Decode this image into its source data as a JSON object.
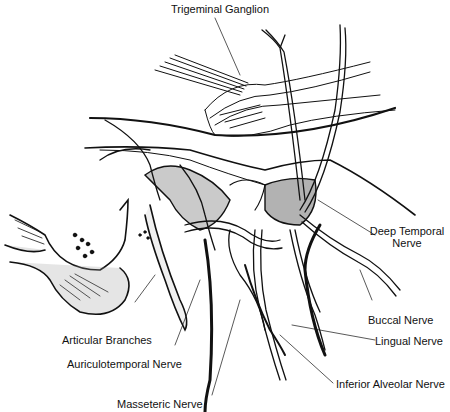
{
  "figure": {
    "labels": {
      "trigeminal_ganglion": "Trigeminal Ganglion",
      "deep_temporal_nerve_line1": "Deep Temporal",
      "deep_temporal_nerve_line2": "Nerve",
      "buccal_nerve": "Buccal Nerve",
      "lingual_nerve": "Lingual Nerve",
      "inferior_alveolar_nerve": "Inferior Alveolar Nerve",
      "articular_branches": "Articular Branches",
      "auriculotemporal_nerve": "Auriculotemporal Nerve",
      "masseteric_nerve": "Masseteric Nerve"
    },
    "colors": {
      "ink": "#111111",
      "background": "#ffffff"
    }
  }
}
